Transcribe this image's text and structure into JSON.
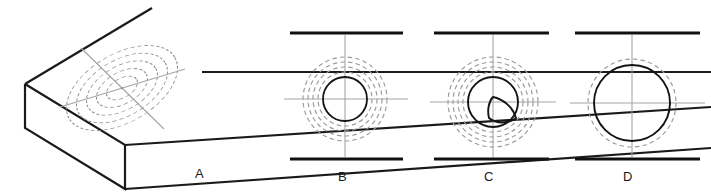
{
  "figure": {
    "type": "engineering-drawing",
    "background": "#ffffff",
    "stroke_solid": "#1a1a1a",
    "stroke_hidden": "#999999",
    "stroke_center": "#aaaaaa",
    "stroke_thick": "#111111"
  },
  "labels": {
    "a": "A",
    "b": "B",
    "c": "C",
    "d": "D"
  },
  "views": {
    "a": {
      "label": "A",
      "kind": "isometric-pictorial",
      "description": "Rectangular slab in isometric projection with four concentric dashed ellipses and crossed centerlines on the top face",
      "hidden_ellipse_count": 4,
      "centerline_count": 2,
      "label_position": {
        "x": 195,
        "y": 166
      }
    },
    "b": {
      "label": "B",
      "kind": "orthographic-top-view",
      "center": {
        "x": 345,
        "y": 99
      },
      "solid_circle_radius": 22,
      "hidden_circle_radii": [
        27,
        32,
        37,
        42
      ],
      "edge_line_y": [
        33,
        159
      ],
      "edge_line_x": [
        290,
        403
      ],
      "label_position": {
        "x": 338,
        "y": 169
      }
    },
    "c": {
      "label": "C",
      "kind": "orthographic-top-view-with-sector",
      "center": {
        "x": 493,
        "y": 102
      },
      "solid_circle_radius": 25,
      "hidden_circle_radii": [
        30,
        35,
        40,
        45
      ],
      "sector_description": "Solid pointed leaf / lens shape from center extending toward lower right to circle edge",
      "edge_line_y": [
        33,
        159
      ],
      "edge_line_x": [
        434,
        549
      ],
      "label_position": {
        "x": 484,
        "y": 169
      }
    },
    "d": {
      "label": "D",
      "kind": "orthographic-top-view",
      "center": {
        "x": 632,
        "y": 103
      },
      "solid_circle_radius": 38,
      "hidden_circle_radii": [
        44
      ],
      "edge_line_y": [
        33,
        159
      ],
      "edge_line_x": [
        575,
        700
      ],
      "label_position": {
        "x": 623,
        "y": 169
      }
    }
  }
}
